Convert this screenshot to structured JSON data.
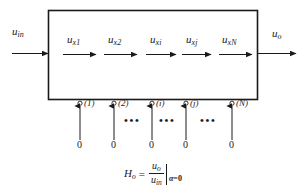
{
  "diagram": {
    "type": "block-diagram",
    "input": {
      "label_base": "u",
      "label_sub": "in",
      "arrow": "right"
    },
    "output": {
      "label_base": "u",
      "label_sub": "o",
      "arrow": "right"
    },
    "box": {
      "x": 48,
      "y": 10,
      "width": 210,
      "height": 90,
      "stroke": "#1a1a1a"
    },
    "stage_arrows": [
      {
        "label_base": "u",
        "label_sub": "x1",
        "x": 63,
        "y": 54,
        "length": 34
      },
      {
        "label_base": "u",
        "label_sub": "x2",
        "x": 104,
        "y": 54,
        "length": 34
      },
      {
        "label_base": "u",
        "label_sub": "xi",
        "x": 146,
        "y": 54,
        "length": 34
      },
      {
        "label_base": "u",
        "label_sub": "xj",
        "x": 182,
        "y": 54,
        "length": 32
      },
      {
        "label_base": "u",
        "label_sub": "xN",
        "x": 219,
        "y": 54,
        "length": 34
      }
    ],
    "taps": [
      {
        "number": "(1)",
        "x": 80,
        "source": "0"
      },
      {
        "number": "(2)",
        "x": 114,
        "source": "0"
      },
      {
        "number": "(i)",
        "x": 152,
        "source": "0"
      },
      {
        "number": "(j)",
        "x": 186,
        "source": "0"
      },
      {
        "number": "(N)",
        "x": 232,
        "source": "0"
      }
    ],
    "ellipses": [
      {
        "text": "•••",
        "x": 124,
        "y": 118
      },
      {
        "text": "•••",
        "x": 159,
        "y": 118
      },
      {
        "text": "•••",
        "x": 198,
        "y": 118
      }
    ],
    "formula": {
      "lhs_base": "H",
      "lhs_sub": "o",
      "equals": "=",
      "numerator_base": "u",
      "numerator_sub": "o",
      "denominator_base": "u",
      "denominator_sub": "in",
      "condition_var": "α",
      "condition_eq": "=",
      "condition_value": "0"
    },
    "colors": {
      "stroke": "#1a1a1a",
      "background": "#ffffff"
    }
  }
}
